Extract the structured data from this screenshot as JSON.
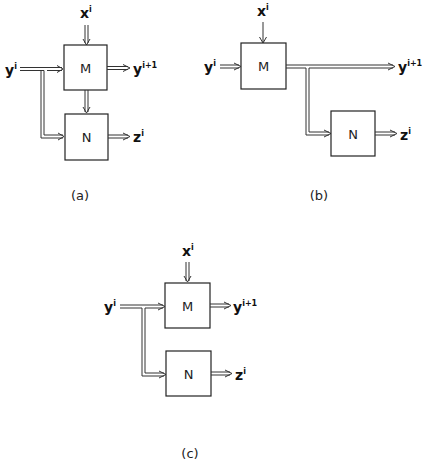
{
  "panels": {
    "a": {
      "caption": "(a)",
      "box_m": "M",
      "box_n": "N",
      "input_x": {
        "base": "x",
        "sup": "i"
      },
      "input_y": {
        "base": "y",
        "sup": "i"
      },
      "output_y": {
        "base": "y",
        "sup": "i+1"
      },
      "output_z": {
        "base": "z",
        "sup": "i"
      }
    },
    "b": {
      "caption": "(b)",
      "box_m": "M",
      "box_n": "N",
      "input_x": {
        "base": "x",
        "sup": "i"
      },
      "input_y": {
        "base": "y",
        "sup": "i"
      },
      "output_y": {
        "base": "y",
        "sup": "i+1"
      },
      "output_z": {
        "base": "z",
        "sup": "i"
      }
    },
    "c": {
      "caption": "(c)",
      "box_m": "M",
      "box_n": "N",
      "input_x": {
        "base": "x",
        "sup": "i"
      },
      "input_y": {
        "base": "y",
        "sup": "i"
      },
      "output_y": {
        "base": "y",
        "sup": "i+1"
      },
      "output_z": {
        "base": "z",
        "sup": "i"
      }
    }
  },
  "colors": {
    "stroke": "#222222",
    "background": "#ffffff"
  }
}
